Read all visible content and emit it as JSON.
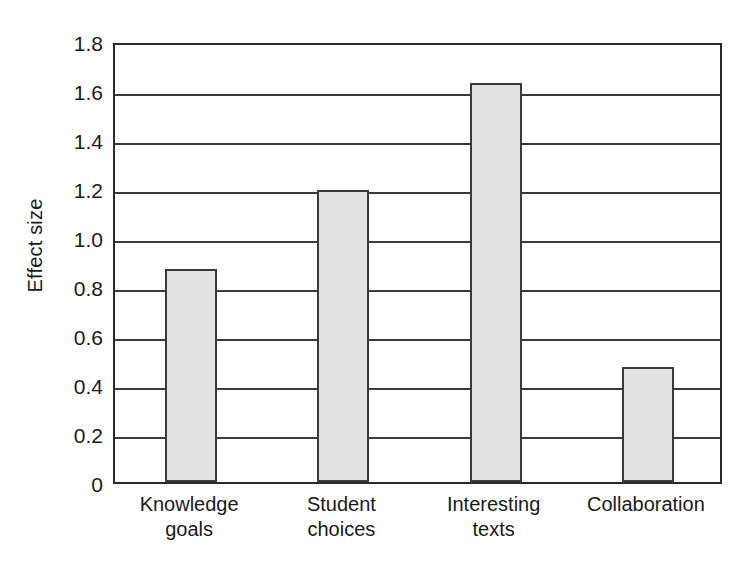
{
  "chart_data": {
    "type": "bar",
    "title": "",
    "subtitle": "",
    "xlabel": "",
    "ylabel": "Effect size",
    "categories": [
      "Knowledge goals",
      "Student choices",
      "Interesting texts",
      "Collaboration"
    ],
    "category_lines": [
      [
        "Knowledge",
        "goals"
      ],
      [
        "Student",
        "choices"
      ],
      [
        "Interesting",
        "texts"
      ],
      [
        "Collaboration"
      ]
    ],
    "values": [
      0.87,
      1.19,
      1.63,
      0.47
    ],
    "ylim": [
      0,
      1.8
    ],
    "ytick_values": [
      0,
      0.2,
      0.4,
      0.6,
      0.8,
      1.0,
      1.2,
      1.4,
      1.6,
      1.8
    ],
    "ytick_labels": [
      "0",
      "0.2",
      "0.4",
      "0.6",
      "0.8",
      "1.0",
      "1.2",
      "1.4",
      "1.6",
      "1.8"
    ],
    "grid": true,
    "grid_axis": "y",
    "legend": false,
    "legend_position": "none",
    "bar_fill_color": "#e2e2e2",
    "bar_edge_color": "#3a3a3a",
    "axis_color": "#2b2b2b",
    "grid_color": "#3a3a3a",
    "background_color": "#ffffff"
  }
}
